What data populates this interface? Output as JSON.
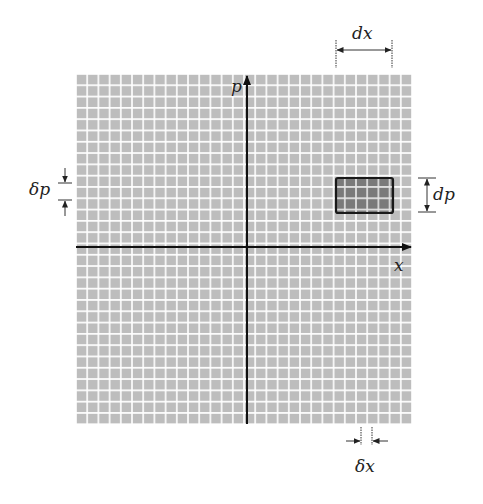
{
  "diagram": {
    "type": "phase-space-grid",
    "axes": {
      "horizontal_label": "x",
      "vertical_label": "p"
    },
    "annotations": {
      "cell_width_label": "dx",
      "cell_height_label": "dp",
      "grid_spacing_x_label": "δx",
      "grid_spacing_p_label": "δp"
    },
    "grid": {
      "columns": 30,
      "rows": 31,
      "highlight_box": {
        "columns": 5,
        "rows": 3
      }
    },
    "colors": {
      "grid_fill": "#bdbdbd",
      "highlight_fill": "#7a7a7a",
      "axis": "#111111",
      "background": "#ffffff"
    }
  }
}
